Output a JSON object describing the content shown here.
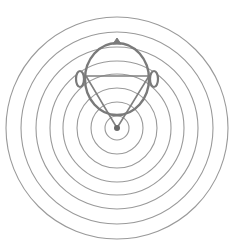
{
  "diagram": {
    "colors": {
      "background": "#ffffff",
      "rings": "#9a9a9a",
      "head": "#7a7a7a",
      "triangle": "#808080",
      "source": "#6a6a6a"
    },
    "source": {
      "cx": 117,
      "cy": 128,
      "r": 3
    },
    "rings": [
      12,
      26,
      40,
      54,
      67,
      81,
      96,
      111
    ],
    "head": {
      "cx": 117,
      "cy": 79,
      "rx": 32,
      "ry": 36
    },
    "nose": {
      "tip_x": 117,
      "tip_y": 38
    },
    "ears": [
      {
        "side": "left",
        "cx": 80,
        "cy": 79,
        "rx": 4,
        "ry": 8
      },
      {
        "side": "right",
        "cx": 154,
        "cy": 79,
        "rx": 4,
        "ry": 8
      }
    ],
    "triangle": {
      "left": {
        "x": 86,
        "y": 76
      },
      "right": {
        "x": 149,
        "y": 76
      },
      "apex": {
        "x": 117,
        "y": 128
      }
    }
  }
}
